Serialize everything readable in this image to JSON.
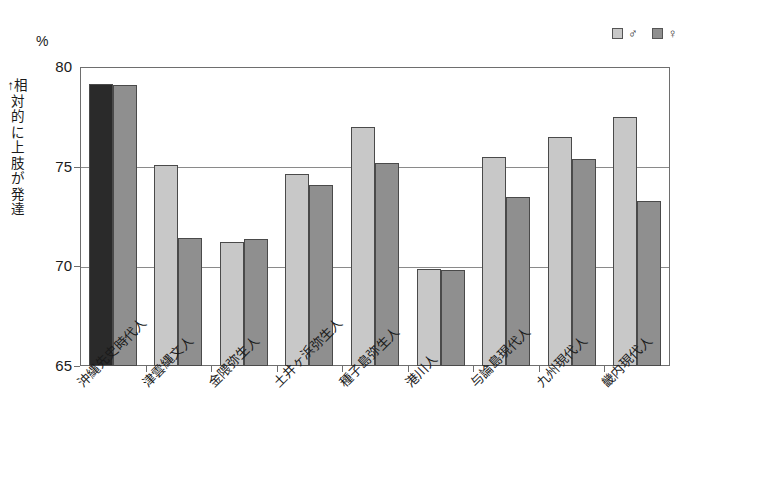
{
  "chart_data": {
    "type": "bar",
    "title": "",
    "subtitle": "",
    "unit_label": "%",
    "ylabel": "↑相対的に上肢が発達",
    "xlabel": "",
    "ylim": [
      65,
      80
    ],
    "yticks": [
      65,
      70,
      75,
      80
    ],
    "ytick_labels": [
      "65",
      "70",
      "75",
      "80"
    ],
    "grid": true,
    "legend_position": "top-right",
    "categories": [
      "沖縄先史時代人",
      "津雲縄文人",
      "金隈弥生人",
      "土井ヶ浜弥生人",
      "種子島弥生人",
      "港川人",
      "与論島現代人",
      "九州現代人",
      "畿内現代人"
    ],
    "series": [
      {
        "name": "♂",
        "values": [
          79.15,
          75.1,
          71.2,
          74.65,
          77.0,
          69.85,
          75.5,
          76.5,
          77.5
        ]
      },
      {
        "name": "♀",
        "values": [
          79.1,
          71.4,
          71.35,
          74.1,
          75.2,
          69.8,
          73.5,
          75.4,
          73.3
        ]
      }
    ],
    "colors": {
      "male": "#c8c8c8",
      "female": "#8f8f8f",
      "male_first_group": "#2a2a2a",
      "female_first_group": "#8f8f8f",
      "bar_outline": "#4a4a4a",
      "axis": "#6e6e6e",
      "gridline": "#8a8a8a",
      "text": "#1a1a1a",
      "background": "#ffffff"
    }
  },
  "legend": {
    "entries": [
      {
        "label": "♂",
        "swatch": "#c8c8c8"
      },
      {
        "label": "♀",
        "swatch": "#8f8f8f"
      }
    ]
  }
}
